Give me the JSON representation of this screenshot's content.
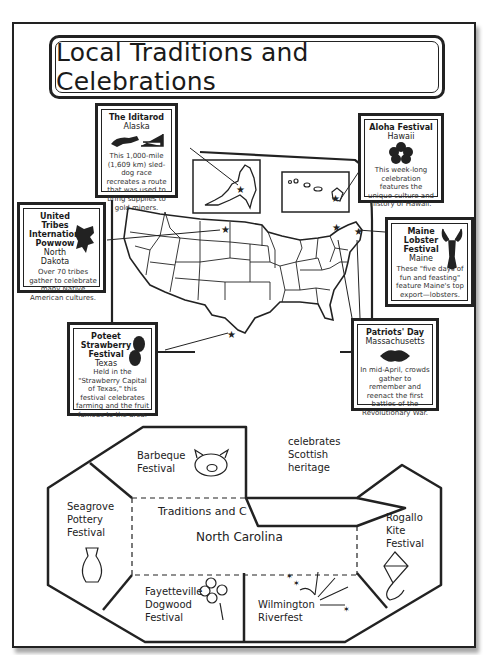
{
  "title": "Local Traditions and Celebrations",
  "cards": {
    "iditarod": {
      "name": "The Iditarod",
      "location": "Alaska",
      "description": "This 1,000-mile (1,609 km) sled-dog race recreates a route that was used to bring supplies to gold miners.",
      "icon": "dog-sled-icon"
    },
    "aloha": {
      "name": "Aloha Festival",
      "location": "Hawaii",
      "description": "This week-long celebration features the unique culture and history of Hawaii.",
      "icon": "hibiscus-icon"
    },
    "powwow": {
      "name": "United Tribes International Powwow",
      "location": "North Dakota",
      "description": "Over 70 tribes gather to celebrate many Native American cultures.",
      "icon": "headdress-icon"
    },
    "lobster": {
      "name": "Maine Lobster Festival",
      "location": "Maine",
      "description": "These \"five days of fun and feasting\" feature Maine's top export—lobsters.",
      "icon": "lobster-icon"
    },
    "strawberry": {
      "name": "Poteet Strawberry Festival",
      "location": "Texas",
      "description": "Held in the \"Strawberry Capital of Texas,\" this festival celebrates farming and the fruit famous to the area.",
      "icon": "strawberry-icon"
    },
    "patriots": {
      "name": "Patriots' Day",
      "location": "Massachusetts",
      "description": "In mid-April, crowds gather to remember and reenact the first battles of the Revolutionary War.",
      "icon": "tricorn-hat-icon"
    }
  },
  "foldable": {
    "center_title": "Traditions and C",
    "center_state": "North Carolina",
    "flaps": {
      "barbeque": "Barbeque Festival",
      "scottish": "celebrates Scottish heritage",
      "seagrove": "Seagrove Pottery Festival",
      "rogallo": "Rogallo Kite Festival",
      "fayetteville": "Fayetteville Dogwood Festival",
      "wilmington": "Wilmington Riverfest"
    }
  }
}
